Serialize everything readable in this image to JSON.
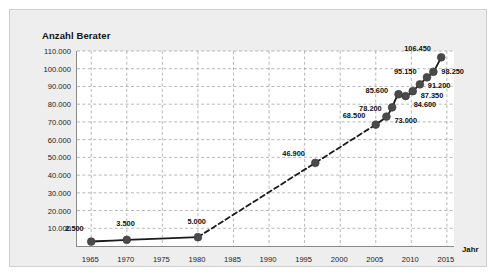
{
  "chart": {
    "title": "Anzahl Berater",
    "xlabel": "Jahr",
    "ylabel": ""
  },
  "chart_data": {
    "type": "line",
    "title": "Anzahl Berater",
    "xlabel": "Jahr",
    "ylabel": "Anzahl Berater",
    "xlim": [
      1963,
      2016
    ],
    "ylim": [
      0,
      110000
    ],
    "grid": true,
    "legend": false,
    "legend_position": "none",
    "xticks": [
      1965,
      1970,
      1975,
      1980,
      1985,
      1990,
      1995,
      2000,
      2005,
      2010,
      2015
    ],
    "xtick_labels": [
      "1965",
      "1970",
      "1975",
      "1980",
      "1985",
      "1990",
      "1995",
      "2000",
      "2005",
      "2010",
      "2015"
    ],
    "yticks": [
      10000,
      20000,
      30000,
      40000,
      50000,
      60000,
      70000,
      80000,
      90000,
      100000,
      110000
    ],
    "ytick_labels": [
      "10.000",
      "20.000",
      "30.000",
      "40.000",
      "50.000",
      "60.000",
      "70.000",
      "80.000",
      "90.000",
      "100.000",
      "110.000"
    ],
    "series": [
      {
        "name": "Anzahl Berater",
        "x": [
          1965,
          1970,
          1980,
          1996.5,
          2005,
          2006.5,
          2007.3,
          2008.2,
          2009.2,
          2010.2,
          2011.2,
          2012.2,
          2013.1,
          2014.2
        ],
        "values": [
          2500,
          3500,
          5000,
          46900,
          68500,
          73000,
          78200,
          85600,
          84600,
          87350,
          91200,
          95150,
          98250,
          106450
        ],
        "labels": [
          "2.500",
          "3.500",
          "5.000",
          "46.900",
          "68.500",
          "73.000",
          "78.200",
          "85.600",
          "84.600",
          "87.350",
          "91.200",
          "95.150",
          "98.250",
          "106.450"
        ],
        "marker": "circle",
        "color": "#4a4a4a",
        "line_color": "#1a1a1a"
      }
    ],
    "annotations": [
      {
        "text": "2.500",
        "x": 1965,
        "y": 2500
      },
      {
        "text": "3.500",
        "x": 1970,
        "y": 3500
      },
      {
        "text": "5.000",
        "x": 1980,
        "y": 5000
      },
      {
        "text": "46.900",
        "x": 1996.5,
        "y": 46900
      },
      {
        "text": "68.500",
        "x": 2005,
        "y": 68500
      },
      {
        "text": "73.000",
        "x": 2006.5,
        "y": 73000
      },
      {
        "text": "78.200",
        "x": 2007.3,
        "y": 78200
      },
      {
        "text": "85.600",
        "x": 2008.2,
        "y": 85600
      },
      {
        "text": "84.600",
        "x": 2009.2,
        "y": 84600
      },
      {
        "text": "87.350",
        "x": 2010.2,
        "y": 87350
      },
      {
        "text": "91.200",
        "x": 2011.2,
        "y": 91200
      },
      {
        "text": "95.150",
        "x": 2012.2,
        "y": 95150
      },
      {
        "text": "98.250",
        "x": 2013.1,
        "y": 98250
      },
      {
        "text": "106.450",
        "x": 2014.2,
        "y": 106450
      }
    ],
    "label_offsets": [
      {
        "dx": -6,
        "dy": -13,
        "anchor": "end"
      },
      {
        "dx": 0,
        "dy": -16,
        "anchor": "middle"
      },
      {
        "dx": 0,
        "dy": -16,
        "anchor": "middle"
      },
      {
        "dx": -9,
        "dy": -9,
        "anchor": "end"
      },
      {
        "dx": -9,
        "dy": -9,
        "anchor": "end"
      },
      {
        "dx": 9,
        "dy": 4,
        "anchor": "start"
      },
      {
        "dx": -9,
        "dy": 1,
        "anchor": "end"
      },
      {
        "dx": -9,
        "dy": -4,
        "anchor": "end"
      },
      {
        "dx": 9,
        "dy": 8,
        "anchor": "start"
      },
      {
        "dx": 9,
        "dy": 4,
        "anchor": "start"
      },
      {
        "dx": 9,
        "dy": 1,
        "anchor": "start"
      },
      {
        "dx": -9,
        "dy": -6,
        "anchor": "end"
      },
      {
        "dx": 9,
        "dy": 0,
        "anchor": "start"
      },
      {
        "dx": -9,
        "dy": -9,
        "anchor": "end"
      }
    ]
  }
}
